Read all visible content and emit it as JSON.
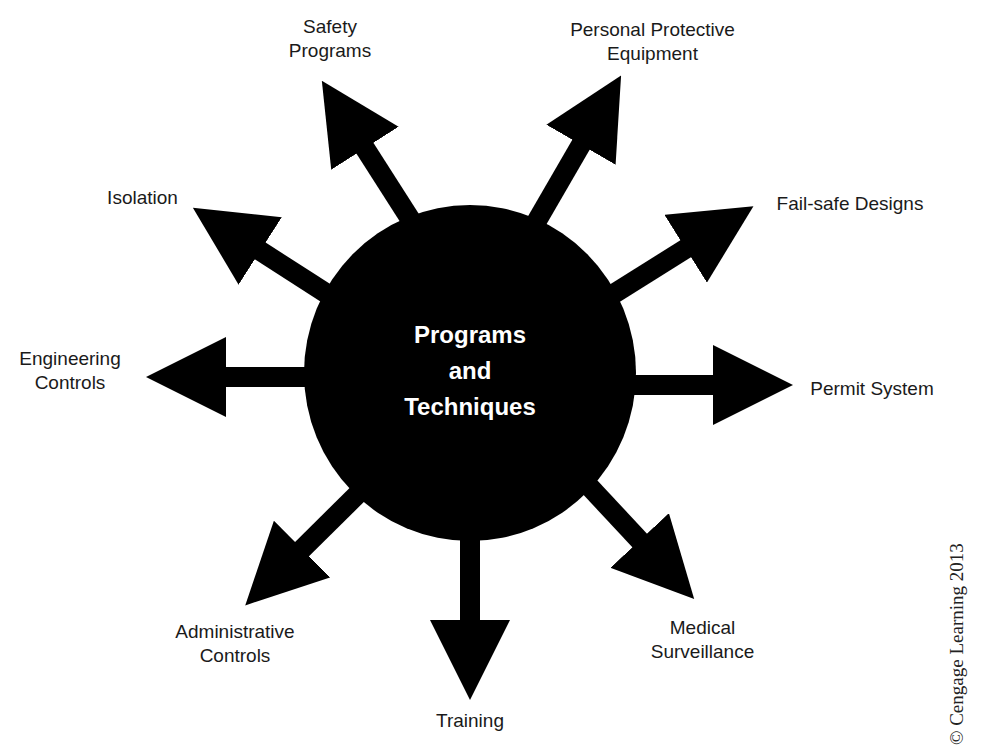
{
  "center": {
    "line1": "Programs",
    "line2": "and",
    "line3": "Techniques"
  },
  "branches": [
    {
      "line1": "Safety",
      "line2": "Programs"
    },
    {
      "line1": "Personal Protective",
      "line2": "Equipment"
    },
    {
      "line1": "Fail-safe Designs"
    },
    {
      "line1": "Permit System"
    },
    {
      "line1": "Medical",
      "line2": "Surveillance"
    },
    {
      "line1": "Training"
    },
    {
      "line1": "Administrative",
      "line2": "Controls"
    },
    {
      "line1": "Engineering",
      "line2": "Controls"
    },
    {
      "line1": "Isolation"
    }
  ],
  "copyright": "© Cengage Learning 2013",
  "colors": {
    "shape": "#000000",
    "background": "#ffffff",
    "text": "#1a1a1a"
  }
}
